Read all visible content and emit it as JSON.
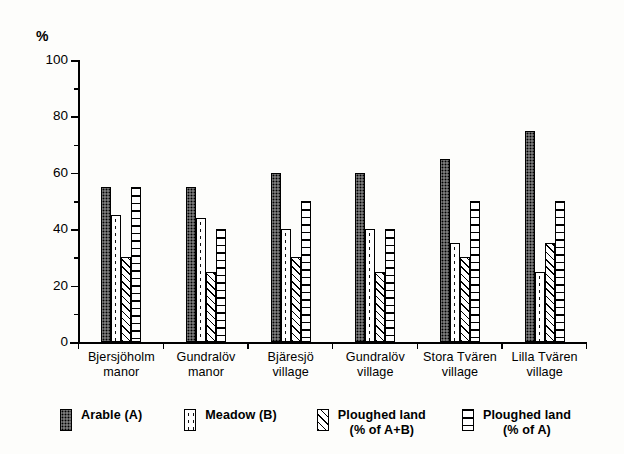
{
  "chart_data": {
    "type": "bar",
    "title": "",
    "xlabel": "",
    "ylabel": "%",
    "ylim": [
      0,
      100
    ],
    "y_major_step": 20,
    "y_minor_step": 10,
    "grid": false,
    "legend_position": "bottom",
    "categories": [
      "Bjersjöholm\nmanor",
      "Gundralöv\nmanor",
      "Bjäresjö\nvillage",
      "Gundralöv\nvillage",
      "Stora Tvären\nvillage",
      "Lilla Tvären\nvillage"
    ],
    "series": [
      {
        "name": "Arable (A)",
        "pattern": "dark-stipple",
        "values": [
          55,
          55,
          60,
          60,
          65,
          75
        ]
      },
      {
        "name": "Meadow (B)",
        "pattern": "sparse-dots",
        "values": [
          45,
          44,
          40,
          40,
          35,
          25
        ]
      },
      {
        "name": "Ploughed land\n(% of A+B)",
        "pattern": "diagonal-hatch",
        "values": [
          30,
          25,
          30,
          25,
          30,
          35
        ]
      },
      {
        "name": "Ploughed land\n(% of A)",
        "pattern": "horizontal-lines",
        "values": [
          55,
          40,
          50,
          40,
          50,
          50
        ]
      }
    ],
    "y_major_ticks": [
      "100",
      "80",
      "60",
      "40",
      "20",
      "0"
    ],
    "y_major_values": [
      100,
      80,
      60,
      40,
      20,
      0
    ],
    "y_minor_values": [
      90,
      70,
      50,
      30,
      10
    ]
  },
  "legend": {
    "items": [
      {
        "label": "Arable (A)"
      },
      {
        "label": "Meadow (B)"
      },
      {
        "label": "Ploughed land\n(% of A+B)"
      },
      {
        "label": "Ploughed land\n(% of A)"
      }
    ]
  },
  "colors": {
    "axis": "#000000",
    "text": "#000000",
    "background": "#fdfdfb",
    "arable_fill": "#4a4a4a"
  }
}
